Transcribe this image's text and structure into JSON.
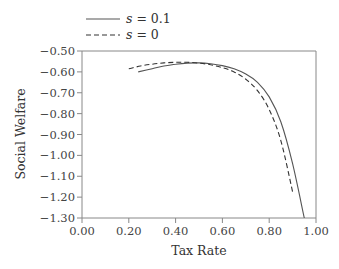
{
  "chart_data": {
    "type": "line",
    "title": "",
    "xlabel": "Tax Rate",
    "ylabel": "Social Welfare",
    "xlim": [
      0.0,
      1.0
    ],
    "ylim": [
      -1.3,
      -0.5
    ],
    "xticks": [
      "0.00",
      "0.20",
      "0.40",
      "0.60",
      "0.80",
      "1.00"
    ],
    "yticks": [
      "-0.50",
      "-0.60",
      "-0.70",
      "-0.80",
      "-0.90",
      "-1.00",
      "-1.10",
      "-1.20",
      "-1.30"
    ],
    "grid": false,
    "legend_position": "top-left (above plot)",
    "series": [
      {
        "name": "s = 0.1",
        "style": "solid",
        "color": "#555555",
        "x": [
          0.24,
          0.3,
          0.35,
          0.4,
          0.45,
          0.5,
          0.55,
          0.6,
          0.65,
          0.7,
          0.75,
          0.8,
          0.85,
          0.9,
          0.95
        ],
        "y": [
          -0.6,
          -0.585,
          -0.572,
          -0.563,
          -0.558,
          -0.557,
          -0.561,
          -0.57,
          -0.585,
          -0.61,
          -0.65,
          -0.72,
          -0.84,
          -1.04,
          -1.3
        ]
      },
      {
        "name": "s = 0",
        "style": "dashed",
        "color": "#333333",
        "x": [
          0.2,
          0.25,
          0.3,
          0.35,
          0.4,
          0.45,
          0.5,
          0.55,
          0.6,
          0.65,
          0.7,
          0.75,
          0.8,
          0.85,
          0.9
        ],
        "y": [
          -0.585,
          -0.572,
          -0.563,
          -0.557,
          -0.554,
          -0.554,
          -0.558,
          -0.566,
          -0.58,
          -0.6,
          -0.635,
          -0.69,
          -0.78,
          -0.93,
          -1.175
        ]
      }
    ]
  },
  "legend": {
    "items": [
      {
        "label": "s = 0.1",
        "style": "solid"
      },
      {
        "label": "s = 0",
        "style": "dashed"
      }
    ]
  }
}
